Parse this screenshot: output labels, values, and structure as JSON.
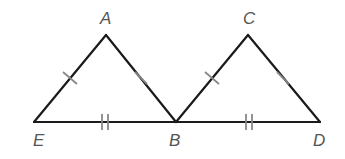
{
  "diagram": {
    "type": "geometry",
    "points": {
      "E": {
        "label": "E",
        "x": 34,
        "y": 122
      },
      "A": {
        "label": "A",
        "x": 106,
        "y": 35
      },
      "B": {
        "label": "B",
        "x": 176,
        "y": 122
      },
      "C": {
        "label": "C",
        "x": 248,
        "y": 35
      },
      "D": {
        "label": "D",
        "x": 320,
        "y": 122
      }
    },
    "segments": [
      "EA",
      "AB",
      "EB",
      "BC",
      "CD",
      "BD"
    ],
    "congruence_marks": {
      "single_tick": [
        "EA",
        "AB",
        "BC",
        "CD"
      ],
      "double_tick": [
        "EB",
        "BD"
      ]
    },
    "labels": {
      "A": "A",
      "B": "B",
      "C": "C",
      "D": "D",
      "E": "E"
    },
    "colors": {
      "edge": "#1a1a1a",
      "tick": "#888888",
      "label": "#555555"
    }
  }
}
